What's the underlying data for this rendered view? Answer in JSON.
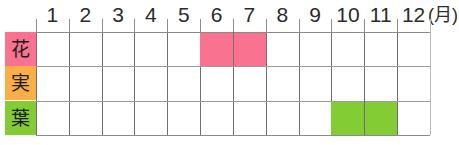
{
  "chart_data": {
    "type": "table",
    "title": "",
    "xlabel": "(月)",
    "ylabel": "",
    "grid": true,
    "unit_label": "(月)",
    "categories": [
      "1",
      "2",
      "3",
      "4",
      "5",
      "6",
      "7",
      "8",
      "9",
      "10",
      "11",
      "12"
    ],
    "rows": [
      {
        "label": "花",
        "label_color": "#f9728f",
        "bar_color": "#f9728f",
        "start_month": 6,
        "end_month": 7,
        "months": [
          6,
          7
        ]
      },
      {
        "label": "実",
        "label_color": "#f9ae46",
        "bar_color": "#f9ae46",
        "start_month": null,
        "end_month": null,
        "months": []
      },
      {
        "label": "葉",
        "label_color": "#84cc33",
        "bar_color": "#84cc33",
        "start_month": 10,
        "end_month": 11,
        "months": [
          10,
          11
        ]
      }
    ],
    "axis_range": [
      1,
      12
    ],
    "legend": []
  },
  "colors": {
    "flower_pink": "#f9728f",
    "fruit_orange": "#f9ae46",
    "leaf_green": "#84cc33",
    "grid_line": "#6f6f6f",
    "grid_line_soft": "#b9b9b9",
    "row_line": "#9a9a9a",
    "tick": "#8d8d8d",
    "text": "#2b2b2b",
    "background": "#ffffff"
  },
  "geometry": {
    "grid_left": 36,
    "grid_top": 32,
    "grid_width": 394,
    "grid_height": 103,
    "column_width": 32.833,
    "row_height": 34.333,
    "label_left": 5,
    "label_width": 31
  }
}
